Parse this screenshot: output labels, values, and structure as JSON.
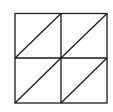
{
  "diagram": {
    "type": "grid-with-diagonals",
    "rows": 2,
    "cols": 2,
    "stroke_color": "#1a1a1a",
    "background": "#ffffff",
    "diagonal_direction": "bottom-left-to-top-right",
    "cells": [
      {
        "row": 0,
        "col": 0,
        "diagonal": true
      },
      {
        "row": 0,
        "col": 1,
        "diagonal": true
      },
      {
        "row": 1,
        "col": 0,
        "diagonal": true
      },
      {
        "row": 1,
        "col": 1,
        "diagonal": true
      }
    ]
  }
}
